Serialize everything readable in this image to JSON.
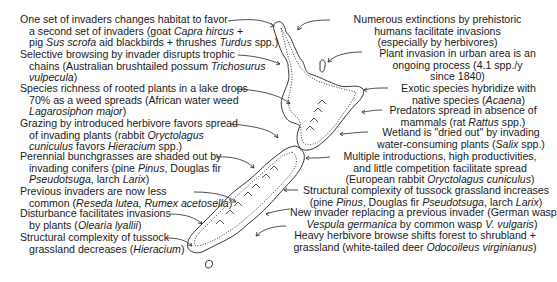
{
  "diagram": {
    "left_labels": [
      {
        "lines": [
          "One set of invaders changes habitat to favor",
          "a second set of invaders (goat <i>Capra hircus</i> +",
          "pig <i>Sus scrofa</i> aid blackbirds + thrushes <i>Turdus</i> spp.)"
        ]
      },
      {
        "lines": [
          "Selective browsing by invader disrupts trophic",
          "chains (Australian brushtailed possum <i>Trichosurus</i>",
          "<i>vulpecula</i>)"
        ]
      },
      {
        "lines": [
          "Species richness of rooted plants in a lake drops",
          "70% as a weed spreads (African water weed",
          "<i>Lagarosiphon major</i>)"
        ]
      },
      {
        "lines": [
          "Grazing by introduced herbivore favors spread",
          "of invading plants (rabbit <i>Oryctolagus</i>",
          "<i>cuniculus</i> favors <i>Hieracium</i> spp.)"
        ]
      },
      {
        "lines": [
          "Perennial bunchgrasses are shaded out by",
          "invading conifers (pine <i>Pinus</i>, Douglas fir",
          "<i>Pseudotsuga</i>, larch <i>Larix</i>)"
        ]
      },
      {
        "lines": [
          "Previous invaders are now less",
          "common (<i>Reseda lutea</i>, <i>Rumex acetosella</i>)"
        ]
      },
      {
        "lines": [
          "Disturbance facilitates invasions",
          "by plants (<i>Olearia lyallii</i>)"
        ]
      },
      {
        "lines": [
          "Structural complexity of tussock",
          "grassland decreases (<i>Hieracium</i>)"
        ]
      }
    ],
    "right_labels": [
      {
        "lines": [
          "Numerous extinctions by prehistoric",
          "humans facilitate invasions",
          "(especially by herbivores)"
        ]
      },
      {
        "lines": [
          "Plant invasion in urban area is an",
          "ongoing process (4.1 spp./y",
          "since 1840)"
        ]
      },
      {
        "lines": [
          "Exotic species hybridize with",
          "native species (<i>Acaena</i>)"
        ]
      },
      {
        "lines": [
          "Predators spread in absence of",
          "mammals (rat <i>Rattus</i> spp.)"
        ]
      },
      {
        "lines": [
          "Wetland is \"dried out\" by invading",
          "water-consuming plants (<i>Salix</i> spp.)"
        ]
      },
      {
        "lines": [
          "Multiple introductions, high productivities,",
          "and little competition facilitate spread",
          "(European rabbit <i>Oryctolagus cuniculus</i>)"
        ]
      },
      {
        "lines": [
          "Structural complexity of tussock grassland increases",
          "(pine <i>Pinus</i>, Douglas fir <i>Pseudotsuga</i>, larch <i>Larix</i>)"
        ]
      },
      {
        "lines": [
          "New invader replacing a previous invader (German wasp",
          "<i>Vespula germanica</i> by common wasp <i>V. vulgaris</i>)"
        ]
      },
      {
        "lines": [
          "Heavy herbivore browse shifts forest to shrubland +",
          "grassland (white-tailed deer <i>Odocoileus virginianus</i>)"
        ]
      }
    ],
    "colors": {
      "ink": "#1a1a1a",
      "background": "#ffffff"
    }
  }
}
